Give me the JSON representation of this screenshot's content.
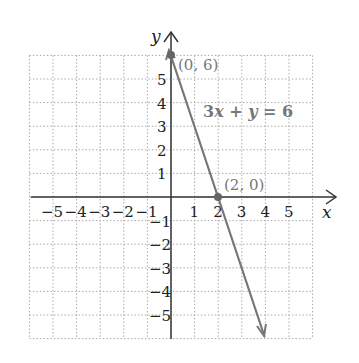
{
  "chart_data": {
    "type": "line",
    "title": "",
    "xlabel": "x",
    "ylabel": "y",
    "xlim": [
      -6,
      6
    ],
    "ylim": [
      -6,
      6
    ],
    "grid": true,
    "x_ticks": [
      "-5",
      "-4",
      "-3",
      "-2",
      "-1",
      "1",
      "2",
      "3",
      "4",
      "5"
    ],
    "y_ticks": [
      "5",
      "4",
      "3",
      "2",
      "1",
      "-1",
      "-2",
      "-3",
      "-4",
      "-5"
    ],
    "series": [
      {
        "name": "3x + y = 6",
        "x": [
          0,
          2,
          4
        ],
        "y": [
          6,
          0,
          -6
        ]
      }
    ],
    "points": [
      {
        "label": "(0, 6)",
        "x": 0,
        "y": 6
      },
      {
        "label": "(2, 0)",
        "x": 2,
        "y": 0
      }
    ],
    "annotations": [
      "3x + y = 6"
    ]
  },
  "labels": {
    "x_axis": "x",
    "y_axis": "y",
    "p1": "(0, 6)",
    "p2": "(2, 0)",
    "eq_a": "3",
    "eq_x": "x",
    "eq_b": " + ",
    "eq_y": "y",
    "eq_c": " = 6"
  }
}
